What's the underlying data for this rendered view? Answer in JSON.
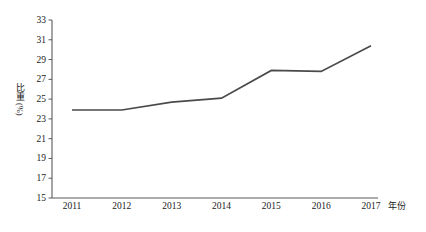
{
  "chart_data": {
    "type": "line",
    "title": "",
    "categories": [
      "2011",
      "2012",
      "2013",
      "2014",
      "2015",
      "2016",
      "2017"
    ],
    "values": [
      23.9,
      23.9,
      24.7,
      25.1,
      27.9,
      27.8,
      30.4
    ],
    "series": [
      {
        "name": "比重",
        "values": [
          23.9,
          23.9,
          24.7,
          25.1,
          27.9,
          27.8,
          30.4
        ]
      }
    ],
    "xlabel": "年份",
    "ylabel": "比重(%)",
    "ylim": [
      15,
      33
    ],
    "ytick_step": 2,
    "yticks": [
      33,
      31,
      29,
      27,
      25,
      23,
      21,
      19,
      17,
      15
    ],
    "xticks": [
      "2011",
      "2012",
      "2013",
      "2014",
      "2015",
      "2016",
      "2017"
    ],
    "grid": false,
    "legend": "none",
    "line_color": "#4a4a4a",
    "axis_color": "#5a5a5a",
    "markers": false
  },
  "axes": {
    "y_title_cjk": "比重",
    "y_title_unit": "(%)",
    "x_title": "年份"
  }
}
